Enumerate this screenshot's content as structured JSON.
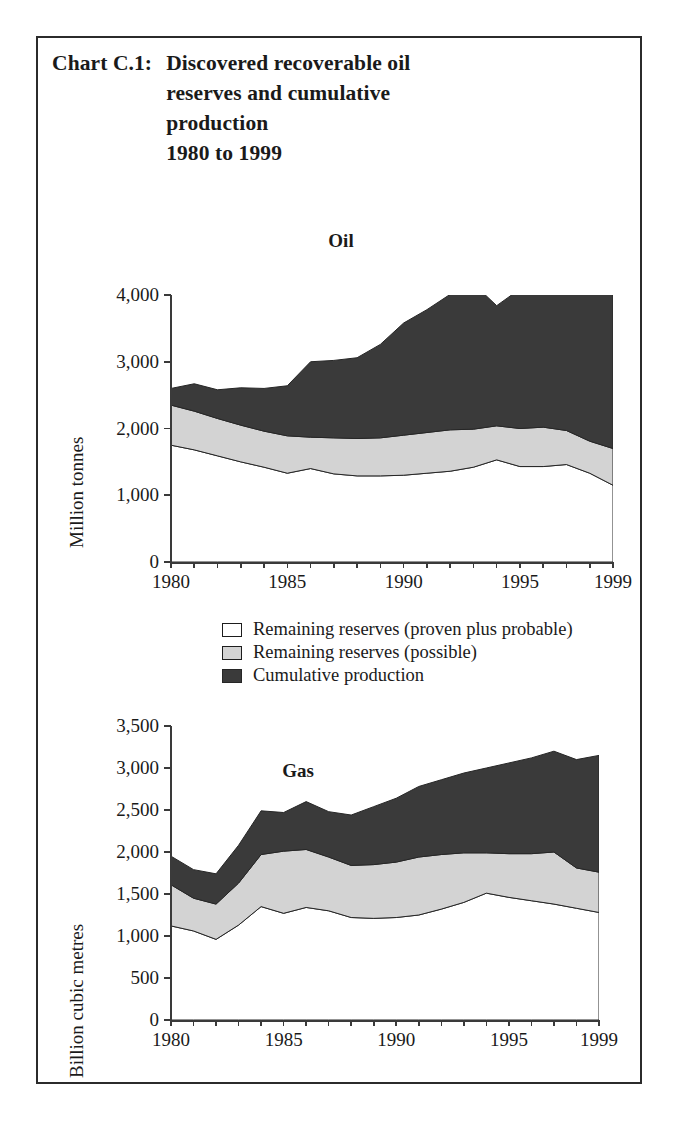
{
  "figure": {
    "label": "Chart C.1:",
    "title_lines": [
      "Discovered recoverable oil",
      "reserves and cumulative",
      "production",
      "1980 to 1999"
    ]
  },
  "legend": {
    "items": [
      {
        "swatch": "white-swatch",
        "label": "Remaining reserves (proven plus probable)",
        "color": "#ffffff"
      },
      {
        "swatch": "light-gray-swatch",
        "label": "Remaining reserves (possible)",
        "color": "#d3d3d3"
      },
      {
        "swatch": "dark-swatch",
        "label": "Cumulative production",
        "color": "#3a3a3a"
      }
    ]
  },
  "chart_data": [
    {
      "type": "area",
      "name": "oil",
      "title": "Oil",
      "xlabel": "",
      "ylabel": "Million tonnes",
      "stacked": true,
      "grid": false,
      "legend_position": "below",
      "xlim": [
        1980,
        1999
      ],
      "ylim": [
        0,
        4000
      ],
      "yticks": [
        0,
        1000,
        2000,
        3000,
        4000
      ],
      "ytick_labels": [
        "0",
        "1,000",
        "2,000",
        "3,000",
        "4,000"
      ],
      "xticks": [
        1980,
        1985,
        1990,
        1995,
        1999
      ],
      "xtick_labels": [
        "1980",
        "1985",
        "1990",
        "1995",
        "1999"
      ],
      "x": [
        1980,
        1981,
        1982,
        1983,
        1984,
        1985,
        1986,
        1987,
        1988,
        1989,
        1990,
        1991,
        1992,
        1993,
        1994,
        1995,
        1996,
        1997,
        1998,
        1999
      ],
      "series": [
        {
          "name": "Remaining reserves (proven plus probable)",
          "color": "#ffffff",
          "values": [
            1750,
            1680,
            1590,
            1500,
            1420,
            1330,
            1400,
            1320,
            1290,
            1290,
            1300,
            1330,
            1360,
            1420,
            1530,
            1430,
            1430,
            1460,
            1330,
            1150
          ]
        },
        {
          "name": "Remaining reserves (possible)",
          "color": "#d3d3d3",
          "values": [
            600,
            580,
            560,
            550,
            540,
            560,
            470,
            540,
            560,
            570,
            600,
            610,
            620,
            570,
            510,
            570,
            590,
            510,
            480,
            550
          ]
        },
        {
          "name": "Cumulative production",
          "color": "#3a3a3a",
          "values": [
            250,
            410,
            430,
            560,
            640,
            750,
            1130,
            1160,
            1210,
            1400,
            1680,
            1840,
            2030,
            2180,
            1800,
            2090,
            2260,
            2270,
            2330,
            2400
          ]
        }
      ],
      "totals": [
        2600,
        2670,
        2580,
        2610,
        2600,
        2640,
        3000,
        3020,
        3060,
        3260,
        3580,
        3780,
        4010,
        4170,
        3840,
        4090,
        4280,
        4240,
        4140,
        4100
      ]
    },
    {
      "type": "area",
      "name": "gas",
      "title": "Gas",
      "xlabel": "",
      "ylabel": "Billion cubic metres",
      "stacked": true,
      "grid": false,
      "legend_position": "shared-above",
      "xlim": [
        1980,
        1999
      ],
      "ylim": [
        0,
        3500
      ],
      "yticks": [
        0,
        500,
        1000,
        1500,
        2000,
        2500,
        3000,
        3500
      ],
      "ytick_labels": [
        "0",
        "500",
        "1,000",
        "1,500",
        "2,000",
        "2,500",
        "3,000",
        "3,500"
      ],
      "xticks": [
        1980,
        1985,
        1990,
        1995,
        1999
      ],
      "xtick_labels": [
        "1980",
        "1985",
        "1990",
        "1995",
        "1999"
      ],
      "x": [
        1980,
        1981,
        1982,
        1983,
        1984,
        1985,
        1986,
        1987,
        1988,
        1989,
        1990,
        1991,
        1992,
        1993,
        1994,
        1995,
        1996,
        1997,
        1998,
        1999
      ],
      "series": [
        {
          "name": "Remaining reserves (proven plus probable)",
          "color": "#ffffff",
          "values": [
            1120,
            1060,
            960,
            1130,
            1350,
            1270,
            1340,
            1300,
            1220,
            1210,
            1220,
            1250,
            1320,
            1400,
            1510,
            1460,
            1420,
            1380,
            1330,
            1280
          ]
        },
        {
          "name": "Remaining reserves (possible)",
          "color": "#d3d3d3",
          "values": [
            490,
            390,
            420,
            500,
            620,
            740,
            690,
            640,
            620,
            640,
            660,
            690,
            650,
            590,
            480,
            520,
            560,
            620,
            480,
            480
          ]
        },
        {
          "name": "Cumulative production",
          "color": "#3a3a3a",
          "values": [
            340,
            340,
            360,
            450,
            520,
            460,
            570,
            540,
            600,
            690,
            760,
            840,
            890,
            950,
            1010,
            1080,
            1140,
            1200,
            1290,
            1390
          ]
        }
      ],
      "totals": [
        1950,
        1790,
        1740,
        2080,
        2490,
        2470,
        2600,
        2480,
        2440,
        2540,
        2640,
        2780,
        2860,
        2940,
        3000,
        3060,
        3120,
        3200,
        3100,
        3150
      ]
    }
  ]
}
